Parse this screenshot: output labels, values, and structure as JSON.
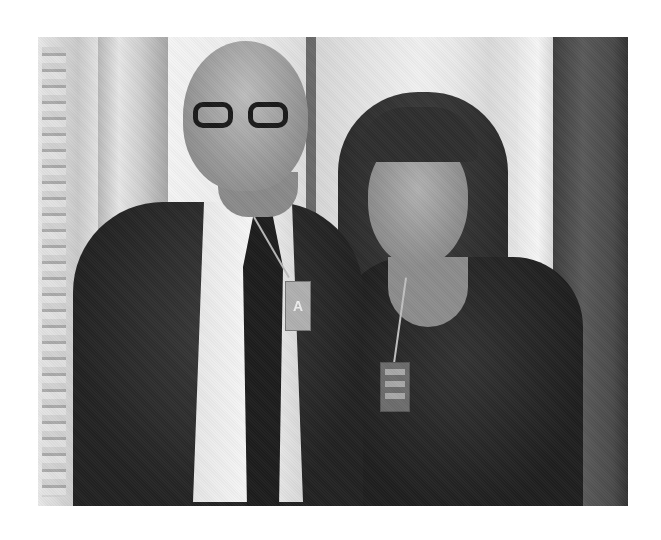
{
  "image": {
    "description": "Grayscale photograph of a bald man with dark-rimmed glasses, white shirt, dark tie and dark suit standing beside a woman with long dark hair and bangs wearing a dark top; both wear lanyard ID badges. Ornate interior with a Greek-key patterned door frame.",
    "subjects": [
      {
        "name": "man",
        "badge_text": "A"
      },
      {
        "name": "woman",
        "badge_text": ""
      }
    ],
    "colors": {
      "background": "#ffffff",
      "tone": "grayscale"
    }
  }
}
